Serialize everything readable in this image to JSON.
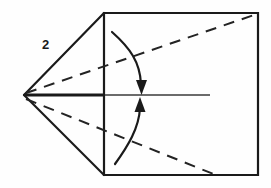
{
  "figure": {
    "kind": "origami-fold-diagram",
    "step_number": "2",
    "canvas": {
      "width": 271,
      "height": 188
    },
    "colors": {
      "background": "#fefefe",
      "ink": "#1a1a1a",
      "dash_ink": "#232323",
      "center_line": "#3a3a3a",
      "label": "#1a1a1a"
    },
    "geometry": {
      "apex": {
        "x": 24,
        "y": 95
      },
      "square": {
        "left": 104,
        "top": 13,
        "right": 258,
        "bottom": 175
      },
      "center_line": {
        "x1": 24,
        "y1": 95,
        "x2": 210,
        "y2": 95
      },
      "center_line_thick_end_x": 104
    },
    "shapes": {
      "square_outline": {
        "name": "paper-square-outline",
        "points": "104,13 258,13 258,175 104,175",
        "stroke_width": 2.2
      },
      "triangle_upper_edge": {
        "name": "flap-upper-solid-edge",
        "x1": 24,
        "y1": 95,
        "x2": 104,
        "y2": 13,
        "stroke_width": 2.2
      },
      "triangle_lower_edge": {
        "name": "flap-lower-solid-edge",
        "x1": 24,
        "y1": 95,
        "x2": 104,
        "y2": 175,
        "stroke_width": 2.2
      },
      "center_spine_thick": {
        "name": "center-spine-thick-segment",
        "x1": 24,
        "y1": 95,
        "x2": 105,
        "y2": 95,
        "stroke_width": 3.0
      },
      "center_spine_thin": {
        "name": "center-spine-thin-segment",
        "x1": 105,
        "y1": 95,
        "x2": 210,
        "y2": 95,
        "stroke_width": 1.3
      },
      "crease_upper_dashed": {
        "name": "crease-line-upper-dashed",
        "x1": 26,
        "y1": 93,
        "x2": 257,
        "y2": 14,
        "stroke_width": 2.0,
        "dash": "11 8"
      },
      "crease_lower_dashed": {
        "name": "crease-line-lower-dashed",
        "x1": 26,
        "y1": 99,
        "x2": 216,
        "y2": 175,
        "stroke_width": 2.0,
        "dash": "11 8"
      },
      "arrow_fold_down": {
        "name": "fold-arrow-downward",
        "path": "M 112,32 C 130,48 140,62 141,84",
        "stroke_width": 2.2,
        "head": "136,80 147,80 141.5,95"
      },
      "arrow_fold_up": {
        "name": "fold-arrow-upward",
        "path": "M 115,164 C 128,146 139,128 140,108",
        "stroke_width": 2.2,
        "head": "134.5,112 145.5,112 140,97"
      }
    },
    "label_position": {
      "x": 42,
      "y": 38
    }
  }
}
